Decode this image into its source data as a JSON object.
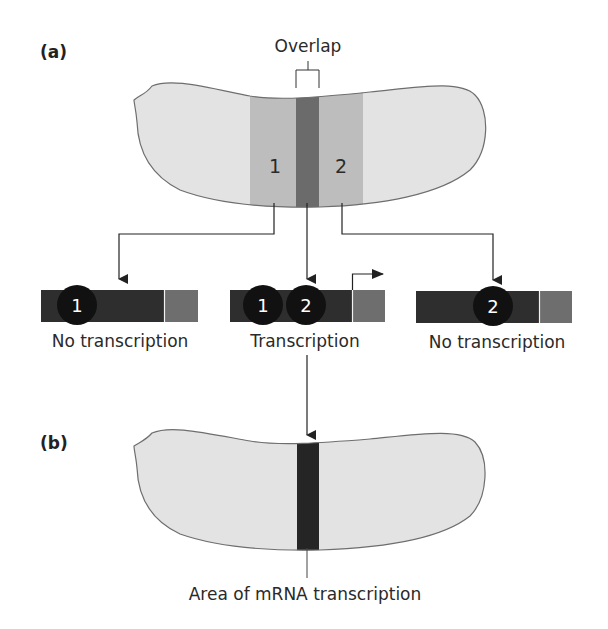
{
  "panel_a": {
    "label": "(a)",
    "overlap_label": "Overlap",
    "region_1_label": "1",
    "region_2_label": "2"
  },
  "genes": [
    {
      "factors": [
        "1"
      ],
      "caption": "No transcription",
      "transcribed": false
    },
    {
      "factors": [
        "1",
        "2"
      ],
      "caption": "Transcription",
      "transcribed": true
    },
    {
      "factors": [
        "2"
      ],
      "caption": "No transcription",
      "transcribed": false
    }
  ],
  "panel_b": {
    "label": "(b)",
    "caption": "Area of mRNA transcription"
  },
  "colors": {
    "embryo_fill": "#e3e3e3",
    "embryo_outline": "#6e6e6e",
    "region_fill": "#bdbdbd",
    "overlap_fill": "#6b6b6b",
    "gene_bar": "#2e2e2e",
    "promoter_box": "#6e6e6e",
    "factor_circle": "#111111",
    "stripe": "#252525",
    "line": "#222222"
  }
}
